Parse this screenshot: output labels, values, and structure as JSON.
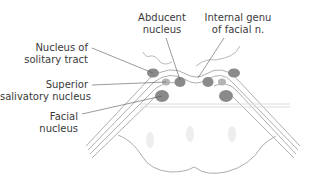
{
  "diagram": {
    "colors": {
      "nucleus_fill": "#8a8a8a",
      "nucleus_light_fill": "#b3b3b3",
      "line": "#9a9a9a",
      "leader": "#555555",
      "text": "#3a3a3a",
      "faint": "#dcdcdc"
    },
    "labels": [
      {
        "id": "nucleus-of-solitary-tract",
        "lines": [
          "Nucleus of",
          "solitary tract"
        ]
      },
      {
        "id": "superior-salivatory-nucleus",
        "lines": [
          "Superior",
          "salivatory nucleus"
        ]
      },
      {
        "id": "facial-nucleus",
        "lines": [
          "Facial",
          "nucleus"
        ]
      },
      {
        "id": "abducent-nucleus",
        "lines": [
          "Abducent",
          "nucleus"
        ]
      },
      {
        "id": "internal-genu-of-facial-n",
        "lines": [
          "Internal genu",
          "of facial n."
        ]
      }
    ]
  }
}
